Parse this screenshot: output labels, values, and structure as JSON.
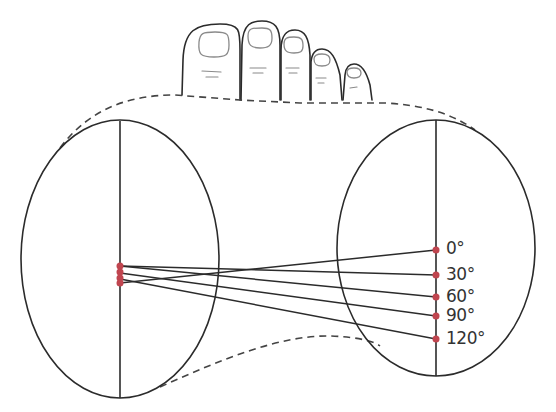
{
  "diagram": {
    "colors": {
      "outline": "#2b2b2b",
      "dashed": "#444444",
      "point": "#c0454f",
      "nail": "#8a8a8a",
      "label": "#333333"
    },
    "angle_labels": [
      {
        "text": "0°",
        "y": 250
      },
      {
        "text": "30°",
        "y": 275
      },
      {
        "text": "60°",
        "y": 297
      },
      {
        "text": "90°",
        "y": 316
      },
      {
        "text": "120°",
        "y": 339
      }
    ],
    "left_points_y": [
      266,
      272,
      278,
      283
    ],
    "right_points_y": [
      250,
      275,
      297,
      316,
      339
    ]
  }
}
